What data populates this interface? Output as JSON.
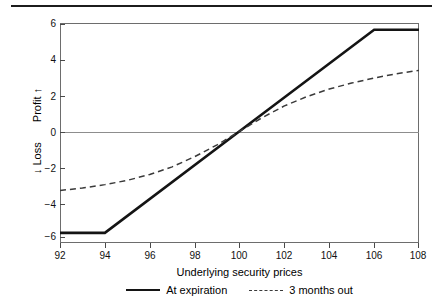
{
  "chart_data": {
    "type": "line",
    "title": "",
    "xlabel": "Underlying security prices",
    "ylabel_profit": "Profit",
    "ylabel_loss": "Loss",
    "ylabel_profit_arrow": "↑",
    "ylabel_loss_arrow": "↓",
    "xlim": [
      92,
      108
    ],
    "ylim": [
      -6.6,
      6.4
    ],
    "xticks": [
      92,
      94,
      96,
      98,
      100,
      102,
      104,
      106,
      108
    ],
    "yticks": [
      6,
      4,
      2,
      0,
      -2,
      -4,
      -6
    ],
    "xtick_labels": [
      "92",
      "94",
      "96",
      "98",
      "100",
      "102",
      "104",
      "106",
      "108"
    ],
    "ytick_labels": [
      "6",
      "4",
      "2",
      "0",
      "−2",
      "−4",
      "−6"
    ],
    "grid": false,
    "zero_line": true,
    "legend_position": "below-axis-center",
    "series": [
      {
        "name": "At expiration",
        "style": "solid",
        "color": "#141414",
        "width": 2.6,
        "x": [
          92,
          94,
          100,
          106,
          108
        ],
        "values": [
          -6,
          -6,
          0,
          6,
          6
        ]
      },
      {
        "name": "3 months out",
        "style": "dashed",
        "color": "#3a3a3a",
        "width": 1.5,
        "x": [
          92,
          93,
          94,
          95,
          96,
          97,
          98,
          99,
          100,
          101,
          102,
          103,
          104,
          105,
          106,
          107,
          108
        ],
        "values": [
          -3.5,
          -3.35,
          -3.15,
          -2.9,
          -2.55,
          -2.1,
          -1.5,
          -0.8,
          0.0,
          0.8,
          1.5,
          2.05,
          2.5,
          2.85,
          3.15,
          3.4,
          3.6
        ]
      }
    ]
  },
  "legend": {
    "items": [
      {
        "label": "At expiration",
        "style": "solid"
      },
      {
        "label": "3 months out",
        "style": "dashed"
      }
    ]
  }
}
